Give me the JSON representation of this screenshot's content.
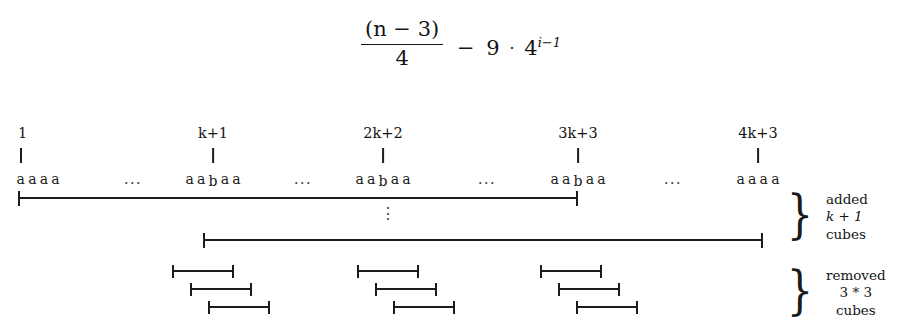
{
  "formula": {
    "numerator": "(n − 3)",
    "numerator_paren_open": "(",
    "numerator_var": "n",
    "numerator_minus": "−",
    "numerator_const": "3",
    "numerator_paren_close": ")",
    "denominator": "4",
    "operator": "−",
    "coefficient": "9",
    "times": "·",
    "base": "4",
    "exponent": "i−1",
    "plain": "(n-3)/4 - 9·4^(i-1)"
  },
  "axis": {
    "positions": [
      {
        "label": "1",
        "x": 22,
        "letters": [
          "a",
          "a",
          "a",
          "a"
        ],
        "has_b": false
      },
      {
        "label": "k+1",
        "x": 213,
        "letters": [
          "a",
          "a",
          "b",
          "a",
          "a"
        ],
        "has_b": true
      },
      {
        "label": "2k+2",
        "x": 383,
        "letters": [
          "a",
          "a",
          "b",
          "a",
          "a"
        ],
        "has_b": true
      },
      {
        "label": "3k+3",
        "x": 578,
        "letters": [
          "a",
          "a",
          "b",
          "a",
          "a"
        ],
        "has_b": true
      },
      {
        "label": "4k+3",
        "x": 758,
        "letters": [
          "a",
          "a",
          "a",
          "a"
        ],
        "has_b": false
      }
    ],
    "gaps": [
      {
        "symbol": "···",
        "x": 133
      },
      {
        "symbol": "···",
        "x": 303
      },
      {
        "symbol": "···",
        "x": 487
      },
      {
        "symbol": "···",
        "x": 673
      }
    ]
  },
  "added_bars": [
    {
      "x": 18,
      "width": 560,
      "y": 196
    },
    {
      "x": 203,
      "width": 560,
      "y": 238
    }
  ],
  "vertical_ellipsis": {
    "symbol": "⋮",
    "x": 388,
    "y": 210
  },
  "removed_groups": [
    {
      "brackets": [
        {
          "x": 172,
          "width": 62,
          "y": 270
        },
        {
          "x": 190,
          "width": 62,
          "y": 288
        },
        {
          "x": 208,
          "width": 62,
          "y": 306
        }
      ]
    },
    {
      "brackets": [
        {
          "x": 357,
          "width": 62,
          "y": 270
        },
        {
          "x": 375,
          "width": 62,
          "y": 288
        },
        {
          "x": 393,
          "width": 62,
          "y": 306
        }
      ]
    },
    {
      "brackets": [
        {
          "x": 540,
          "width": 62,
          "y": 270
        },
        {
          "x": 558,
          "width": 62,
          "y": 288
        },
        {
          "x": 576,
          "width": 62,
          "y": 306
        }
      ]
    }
  ],
  "annotations": [
    {
      "name": "added",
      "brace": "}",
      "brace_x": 800,
      "brace_y": 192,
      "text_x": 826,
      "text_y": 192,
      "lines": [
        "added",
        "k + 1",
        "cubes"
      ],
      "italic_line_index": 1
    },
    {
      "name": "removed",
      "brace": "}",
      "brace_x": 800,
      "brace_y": 268,
      "text_x": 826,
      "text_y": 268,
      "lines": [
        "removed",
        "3 * 3",
        "cubes"
      ],
      "italic_line_index": -1
    }
  ],
  "colors": {
    "background": "#ffffff",
    "ink": "#1a1a1a",
    "rule": "#1c1c1c"
  }
}
